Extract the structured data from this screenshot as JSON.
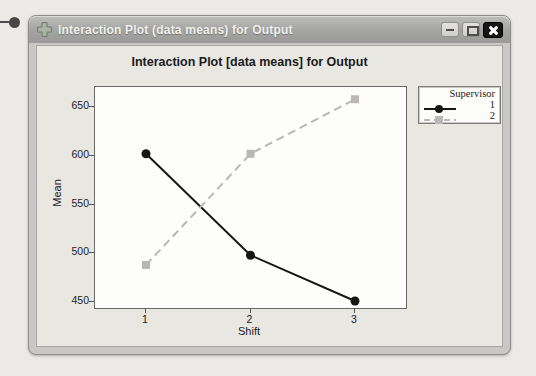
{
  "window": {
    "title": "Interaction Plot (data means) for Output",
    "icons": {
      "app": "plus-cross-icon",
      "minimize": "dash",
      "maximize": "square-outline",
      "close": "white-x-on-black"
    }
  },
  "chart_data": {
    "type": "line",
    "title": "Interaction Plot [data means] for Output",
    "xlabel": "Shift",
    "ylabel": "Mean",
    "categories": [
      "1",
      "2",
      "3"
    ],
    "series": [
      {
        "name": "1",
        "color": "#161616",
        "marker": "circle",
        "line": "solid",
        "values": [
          602,
          498,
          451
        ]
      },
      {
        "name": "2",
        "color": "#b9b8b6",
        "marker": "square",
        "line": "dashed",
        "values": [
          488,
          602,
          658
        ]
      }
    ],
    "yticks": [
      450,
      500,
      550,
      600,
      650
    ],
    "ylim": [
      450,
      650
    ],
    "legend_title": "Supervisor",
    "legend_position": "outside-top-right",
    "grid": false
  },
  "colors": {
    "page_bg": "#eceae6",
    "titlebar": "#a4a4a2",
    "panel_bg": "#e9e7e2",
    "plot_bg": "#fdfdfb",
    "series1": "#161616",
    "series2": "#b9b8b6"
  }
}
